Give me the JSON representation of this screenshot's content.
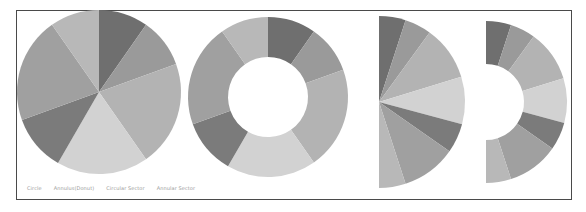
{
  "legend": {
    "items": [
      "Circle",
      "Annulus(Donut)",
      "Circular Sector",
      "Annular Sector"
    ]
  },
  "colors": {
    "frame_border": "#4a4a4a",
    "legend_text": "#9a9a9a"
  },
  "chart_data": [
    {
      "type": "pie",
      "title": "Circle",
      "center": [
        99,
        92
      ],
      "radius": 82,
      "inner_radius": 0,
      "start_angle": -90,
      "end_angle": 270,
      "values": [
        35,
        35,
        75,
        65,
        40,
        75,
        35
      ],
      "colors": [
        "#6f6f6f",
        "#9a9a9a",
        "#b3b3b3",
        "#d2d2d2",
        "#7b7b7b",
        "#a0a0a0",
        "#b8b8b8"
      ]
    },
    {
      "type": "pie",
      "title": "Annulus(Donut)",
      "center": [
        268,
        97
      ],
      "radius": 80,
      "inner_radius": 40,
      "start_angle": -90,
      "end_angle": 270,
      "values": [
        35,
        35,
        75,
        65,
        40,
        75,
        35
      ],
      "colors": [
        "#6f6f6f",
        "#9a9a9a",
        "#b3b3b3",
        "#d2d2d2",
        "#7b7b7b",
        "#a0a0a0",
        "#b8b8b8"
      ]
    },
    {
      "type": "pie",
      "title": "Circular Sector",
      "center": [
        379,
        102
      ],
      "radius": 86,
      "inner_radius": 0,
      "start_angle": -90,
      "end_angle": 90,
      "values": [
        18,
        18,
        37,
        32,
        20,
        37,
        18
      ],
      "colors": [
        "#6f6f6f",
        "#9a9a9a",
        "#b3b3b3",
        "#d2d2d2",
        "#7b7b7b",
        "#a0a0a0",
        "#b8b8b8"
      ]
    },
    {
      "type": "pie",
      "title": "Annular Sector",
      "center": [
        486,
        102
      ],
      "radius": 81,
      "inner_radius": 38,
      "start_angle": -90,
      "end_angle": 90,
      "values": [
        18,
        18,
        37,
        32,
        20,
        37,
        18
      ],
      "colors": [
        "#6f6f6f",
        "#9a9a9a",
        "#b3b3b3",
        "#d2d2d2",
        "#7b7b7b",
        "#a0a0a0",
        "#b8b8b8"
      ]
    }
  ]
}
